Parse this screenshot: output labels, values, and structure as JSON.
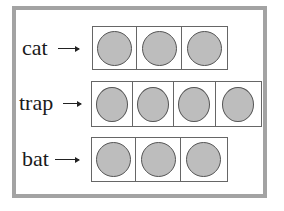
{
  "diagram": {
    "rows": [
      {
        "word": "cat",
        "cells": 3,
        "dots": 3
      },
      {
        "word": "trap",
        "cells": 4,
        "dots": 4
      },
      {
        "word": "bat",
        "cells": 3,
        "dots": 3
      }
    ],
    "colors": {
      "frame": "#a3a3a3",
      "dot_fill": "#bdbdbd",
      "dot_stroke": "#555555",
      "box_stroke": "#666666"
    }
  }
}
